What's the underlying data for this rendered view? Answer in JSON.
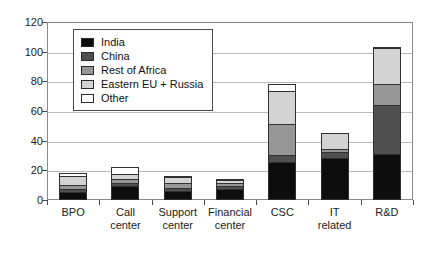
{
  "chart_data": {
    "type": "bar",
    "subtype": "stacked-bar",
    "title": "",
    "xlabel": "",
    "ylabel": "",
    "ylim": [
      0,
      120
    ],
    "yticks": [
      0,
      20,
      40,
      60,
      80,
      100,
      120
    ],
    "grid": true,
    "legend_position": "top-left",
    "categories": [
      "BPO",
      "Call center",
      "Support center",
      "Financial center",
      "CSC",
      "IT related",
      "R&D"
    ],
    "category_lines": [
      [
        "BPO"
      ],
      [
        "Call",
        "center"
      ],
      [
        "Support",
        "center"
      ],
      [
        "Financial",
        "center"
      ],
      [
        "CSC"
      ],
      [
        "IT",
        "related"
      ],
      [
        "R&D"
      ]
    ],
    "series": [
      {
        "name": "India",
        "color": "#0d0d0d",
        "values": [
          4,
          8,
          5,
          6,
          24,
          27,
          30
        ]
      },
      {
        "name": "China",
        "color": "#4f4f4f",
        "values": [
          2,
          2,
          2,
          2,
          5,
          4,
          33
        ]
      },
      {
        "name": "Rest of Africa",
        "color": "#969696",
        "values": [
          3,
          3,
          3,
          2,
          21,
          2,
          14
        ]
      },
      {
        "name": "Eastern EU + Russia",
        "color": "#d3d3d3",
        "values": [
          6,
          3,
          4,
          2,
          22,
          11,
          24
        ]
      },
      {
        "name": "Other",
        "color": "#ffffff",
        "values": [
          2,
          5,
          1,
          1,
          5,
          0,
          1
        ]
      }
    ],
    "totals": [
      17,
      21,
      15,
      13,
      77,
      44,
      102
    ]
  }
}
